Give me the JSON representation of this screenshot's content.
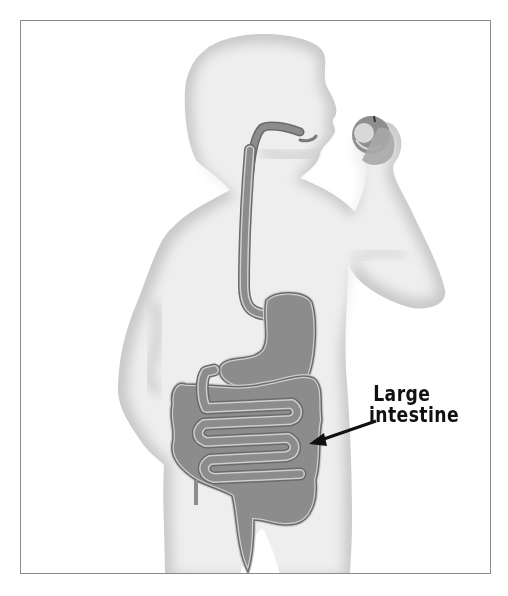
{
  "figure": {
    "callout": {
      "line1": "Large",
      "line2": "intestine",
      "target": "large intestine"
    },
    "colors": {
      "frame": "#8a8a8a",
      "body_fill": "#eeeeee",
      "body_edge": "#bdbdbd",
      "organ_fill": "#8c8c8c",
      "organ_outline": "#6a6a6a",
      "organ_highlight": "#cfcfcf",
      "label_text": "#111111",
      "arrow": "#111111"
    }
  }
}
